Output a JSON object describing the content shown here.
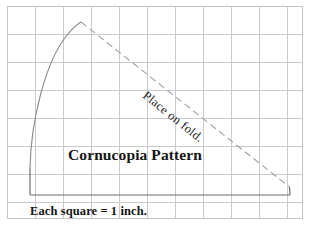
{
  "document": {
    "title": "Cornucopia Pattern",
    "background_color": "#ffffff",
    "width": 310,
    "height": 225
  },
  "labels": {
    "title": "Cornucopia Pattern",
    "scale_note": "Each square = 1 inch.",
    "fold_note": "Place on fold."
  },
  "colors": {
    "grid_line": "#c9c9cf",
    "outer_border": "#c4c4ca",
    "pattern_curve": "#8b8b90",
    "pattern_solid": "#6f6f74",
    "fold_dashed": "#a0a0a6",
    "text": "#151515",
    "background": "#ffffff"
  },
  "grid": {
    "cell_size_px": 28,
    "cell_meaning": "1 inch",
    "x_start": 7,
    "y_start": 6,
    "x_end": 303,
    "y_end": 219,
    "vertical_lines": [
      7,
      35,
      63,
      91,
      119,
      147,
      175,
      203,
      231,
      259,
      287,
      303
    ],
    "horizontal_lines": [
      6,
      34,
      62,
      90,
      118,
      146,
      174,
      202,
      219
    ]
  },
  "pattern": {
    "curve_path": "M 30 168 C 31 118 46 66 62 42 C 70 30 76 25 81 22",
    "apex_point": [
      81,
      22
    ],
    "curve_base_point": [
      30,
      168
    ],
    "left_edge": "M 30 168 L 30 195",
    "base_edge": "M 30 195 L 290 195",
    "right_edge": "M 289.5 187 L 290 195",
    "fold_path": "M 81 22 L 289.5 187"
  },
  "text_placement": {
    "title_x": 135,
    "title_y": 160,
    "scale_x": 30,
    "scale_y": 215,
    "fold_x": 142,
    "fold_y": 97,
    "fold_rotation_deg": 38.5
  }
}
